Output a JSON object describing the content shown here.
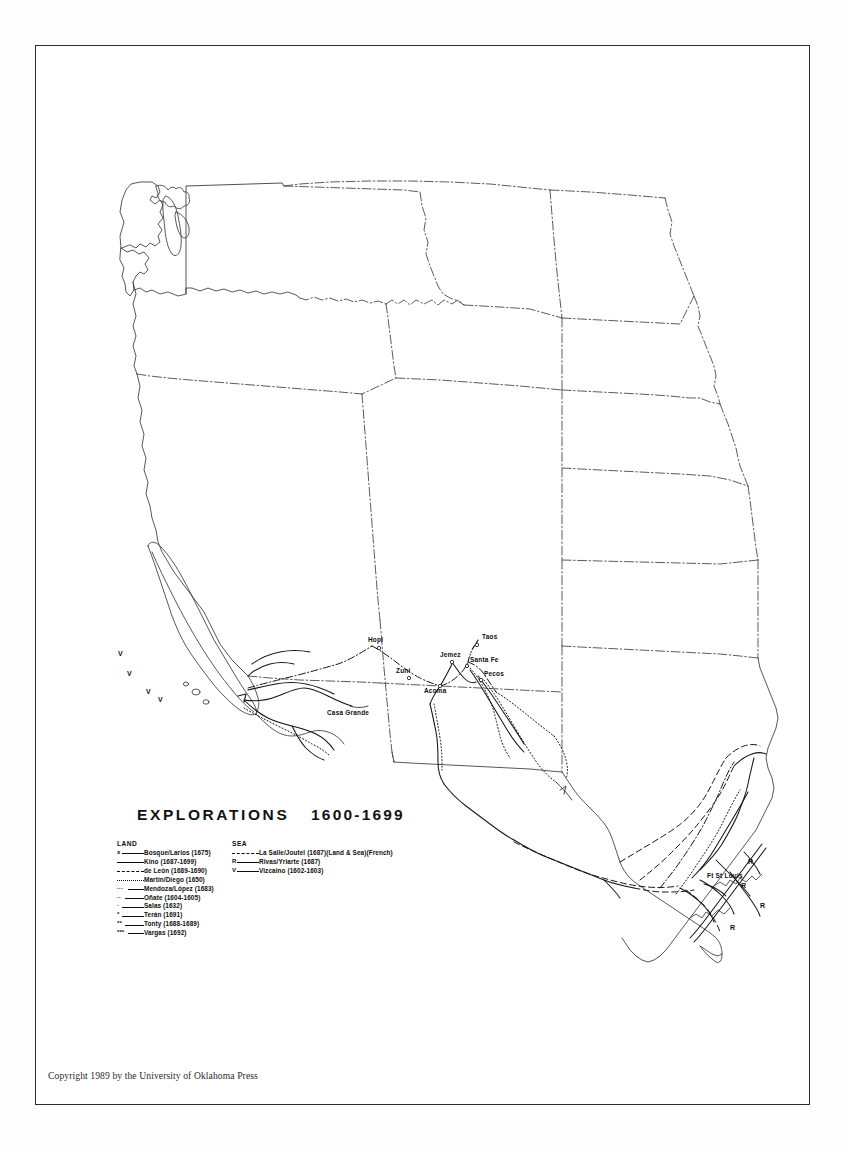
{
  "document": {
    "title": "EXPLORATIONS",
    "years": "1600-1699",
    "copyright": "Copyright 1989 by the University of Oklahoma Press"
  },
  "legend": {
    "land_heading": "LAND",
    "sea_heading": "SEA",
    "land_entries": [
      {
        "symbol": "x",
        "prefix": "x",
        "style": "solid",
        "label": "Bosque/Larios (1675)"
      },
      {
        "symbol": "line",
        "prefix": "",
        "style": "solid",
        "label": "Kino (1687-1699)"
      },
      {
        "symbol": "dash",
        "prefix": "",
        "style": "dashed",
        "label": "de León (1689-1690)"
      },
      {
        "symbol": "dotted",
        "prefix": "",
        "style": "dotted",
        "label": "Martín/Diego (1650)"
      },
      {
        "symbol": "tripledot-line",
        "prefix": "···",
        "style": "solid",
        "label": "Mendoza/López (1683)"
      },
      {
        "symbol": "doubledot-line",
        "prefix": "··",
        "style": "solid",
        "label": "Oñate (1604-1605)"
      },
      {
        "symbol": "dot-line",
        "prefix": "·",
        "style": "solid",
        "label": "Salas (1632)"
      },
      {
        "symbol": "star-line",
        "prefix": "*",
        "style": "solid",
        "label": "Terán (1691)"
      },
      {
        "symbol": "doublestar-line",
        "prefix": "**",
        "style": "solid",
        "label": "Tonty (1688-1689)"
      },
      {
        "symbol": "triplestar-line",
        "prefix": "***",
        "style": "solid",
        "label": "Vargas (1692)"
      }
    ],
    "sea_entries": [
      {
        "symbol": "dash",
        "prefix": "",
        "style": "dashed",
        "label": "La Salle/Joutel (1687)(Land & Sea)(French)"
      },
      {
        "symbol": "R",
        "prefix": "R",
        "style": "solid",
        "label": "Rivas/Yriarte (1687)"
      },
      {
        "symbol": "V",
        "prefix": "V",
        "style": "solid",
        "label": "Vizcaino (1602-1603)"
      }
    ]
  },
  "map": {
    "region": "Western United States and northern Mexico",
    "places": [
      {
        "name": "Hopi",
        "x": 368,
        "y": 639,
        "dotx": 379,
        "doty": 648
      },
      {
        "name": "Zuni",
        "x": 396,
        "y": 670,
        "dotx": 409,
        "doty": 678
      },
      {
        "name": "Acoma",
        "x": 425,
        "y": 690,
        "dotx": 440,
        "doty": 686
      },
      {
        "name": "Jemez",
        "x": 440,
        "y": 654,
        "dotx": 452,
        "doty": 662
      },
      {
        "name": "Santa Fe",
        "x": 470,
        "y": 659,
        "dotx": 467,
        "doty": 666
      },
      {
        "name": "Taos",
        "x": 481,
        "y": 636,
        "dotx": 477,
        "doty": 645
      },
      {
        "name": "Pecos",
        "x": 483,
        "y": 673,
        "dotx": 481,
        "doty": 680
      },
      {
        "name": "Casa Grande",
        "x": 327,
        "y": 711,
        "dotx": 0,
        "doty": 0
      },
      {
        "name": "Ft St Louis",
        "x": 707,
        "y": 875,
        "dotx": 0,
        "doty": 0
      }
    ],
    "sea_markers": [
      {
        "label": "V",
        "x": 118,
        "y": 654
      },
      {
        "label": "V",
        "x": 127,
        "y": 674
      },
      {
        "label": "V",
        "x": 146,
        "y": 692
      },
      {
        "label": "V",
        "x": 158,
        "y": 700
      },
      {
        "label": "R",
        "x": 748,
        "y": 862
      },
      {
        "label": "R",
        "x": 741,
        "y": 886
      },
      {
        "label": "R",
        "x": 760,
        "y": 906
      },
      {
        "label": "R",
        "x": 730,
        "y": 928
      }
    ]
  }
}
